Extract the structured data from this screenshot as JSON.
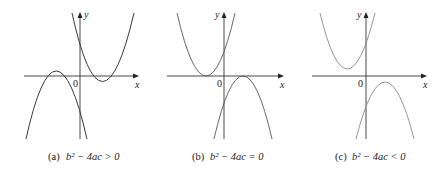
{
  "figure": {
    "panels": [
      {
        "id": "a",
        "caption_tag": "(a)",
        "caption_expr": "b² − 4ac > 0",
        "x_label": "x",
        "y_label": "y",
        "origin_label": "0",
        "description": "Two parabolas each crossing the x-axis twice"
      },
      {
        "id": "b",
        "caption_tag": "(b)",
        "caption_expr": "b² − 4ac = 0",
        "x_label": "x",
        "y_label": "y",
        "origin_label": "0",
        "description": "Two parabolas each tangent to the x-axis"
      },
      {
        "id": "c",
        "caption_tag": "(c)",
        "caption_expr": "b² − 4ac < 0",
        "x_label": "x",
        "y_label": "y",
        "origin_label": "0",
        "description": "Two parabolas not touching the x-axis"
      }
    ]
  }
}
